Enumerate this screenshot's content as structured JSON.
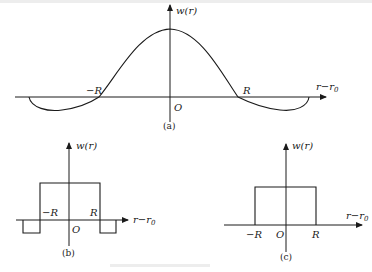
{
  "figure": {
    "panels": [
      {
        "id": "a",
        "caption": "(a)",
        "y_label": "w(r)",
        "x_label": "r−r",
        "x_label_sub": "0",
        "origin_label": "O",
        "neg_R_label": "−R",
        "pos_R_label": "R",
        "shape": "smooth bump (Mexican-hat-like) with negative side lobes"
      },
      {
        "id": "b",
        "caption": "(b)",
        "y_label": "w(r)",
        "x_label": "r−r",
        "x_label_sub": "0",
        "origin_label": "O",
        "neg_R_label": "−R",
        "pos_R_label": "R",
        "shape": "rectangular pulse with negative rectangular side lobes"
      },
      {
        "id": "c",
        "caption": "(c)",
        "y_label": "w(r)",
        "x_label": "r−r",
        "x_label_sub": "0",
        "origin_label": "O",
        "neg_R_label": "−R",
        "pos_R_label": "R",
        "shape": "rectangular pulse"
      }
    ]
  }
}
